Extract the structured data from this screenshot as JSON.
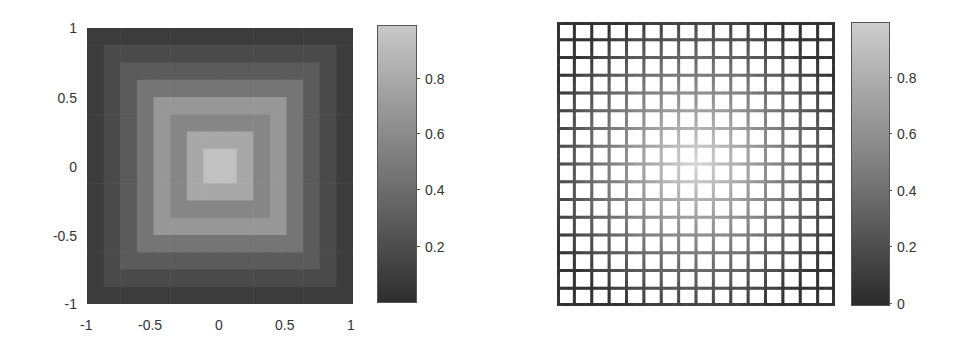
{
  "chart_data": [
    {
      "type": "heatmap",
      "title": "",
      "xlabel": "",
      "ylabel": "",
      "xlim": [
        -1,
        1
      ],
      "ylim": [
        -1,
        1
      ],
      "x_ticks": [
        "-1",
        "-0.5",
        "0",
        "0.5",
        "1"
      ],
      "y_ticks": [
        "1",
        "0.5",
        "0",
        "-0.5",
        "-1"
      ],
      "grid_size": [
        16,
        16
      ],
      "colormap": "gray",
      "colorbar": {
        "ticks": [
          "0.8",
          "0.6",
          "0.4",
          "0.2"
        ],
        "range": [
          0,
          1
        ]
      },
      "description": "Concentric square rings (max-norm distance from center) with bright center ~0.9, alternating mid-gray rings, dark border ~0.1",
      "ring_values": [
        0.9,
        0.75,
        0.55,
        0.65,
        0.45,
        0.3,
        0.2,
        0.12
      ]
    },
    {
      "type": "heatmap",
      "title": "",
      "xlabel": "",
      "ylabel": "",
      "grid_size": [
        16,
        16
      ],
      "colormap": "gray",
      "style": "mesh grid with white cell faces, edges colored by value",
      "description": "16x16 mesh grid; edge color brightest at center (~1) and darkest at border (~0)",
      "colorbar": {
        "ticks": [
          "0.8",
          "0.6",
          "0.4",
          "0.2",
          "0"
        ],
        "range": [
          0,
          1
        ]
      }
    }
  ],
  "left": {
    "x_ticks": [
      "-1",
      "-0.5",
      "0",
      "0.5",
      "1"
    ],
    "y_ticks": [
      "1",
      "0.5",
      "0",
      "-0.5",
      "-1"
    ],
    "colorbar_ticks": [
      "0.8",
      "0.6",
      "0.4",
      "0.2"
    ]
  },
  "right": {
    "colorbar_ticks": [
      "0.8",
      "0.6",
      "0.4",
      "0.2",
      "0"
    ]
  }
}
